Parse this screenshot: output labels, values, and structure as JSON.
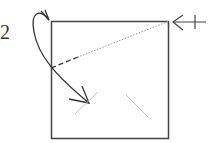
{
  "diagram": {
    "type": "origami-fold-instruction",
    "step_number": "2",
    "paper": {
      "shape": "square",
      "x": 51,
      "y": 21,
      "width": 118,
      "height": 118,
      "stroke": "#444444"
    },
    "fold_line": {
      "style": "dotted-with-dashed-end",
      "from": [
        168,
        21
      ],
      "to": [
        51,
        68
      ],
      "color": "#999999",
      "dashed_color": "#333333"
    },
    "curved_arrow": {
      "description": "fold top-left corner down toward lower interior",
      "start": [
        36,
        15
      ],
      "end": [
        89,
        103
      ],
      "color": "#333333"
    },
    "pivot_marker": {
      "symbol": "arrow-with-cross",
      "position": [
        172,
        22
      ],
      "color": "#444444"
    },
    "crease_marks": [
      {
        "from": [
          75,
          114
        ],
        "to": [
          98,
          92
        ],
        "color": "#bbbbbb"
      },
      {
        "from": [
          126,
          95
        ],
        "to": [
          148,
          117
        ],
        "color": "#bbbbbb"
      }
    ]
  }
}
